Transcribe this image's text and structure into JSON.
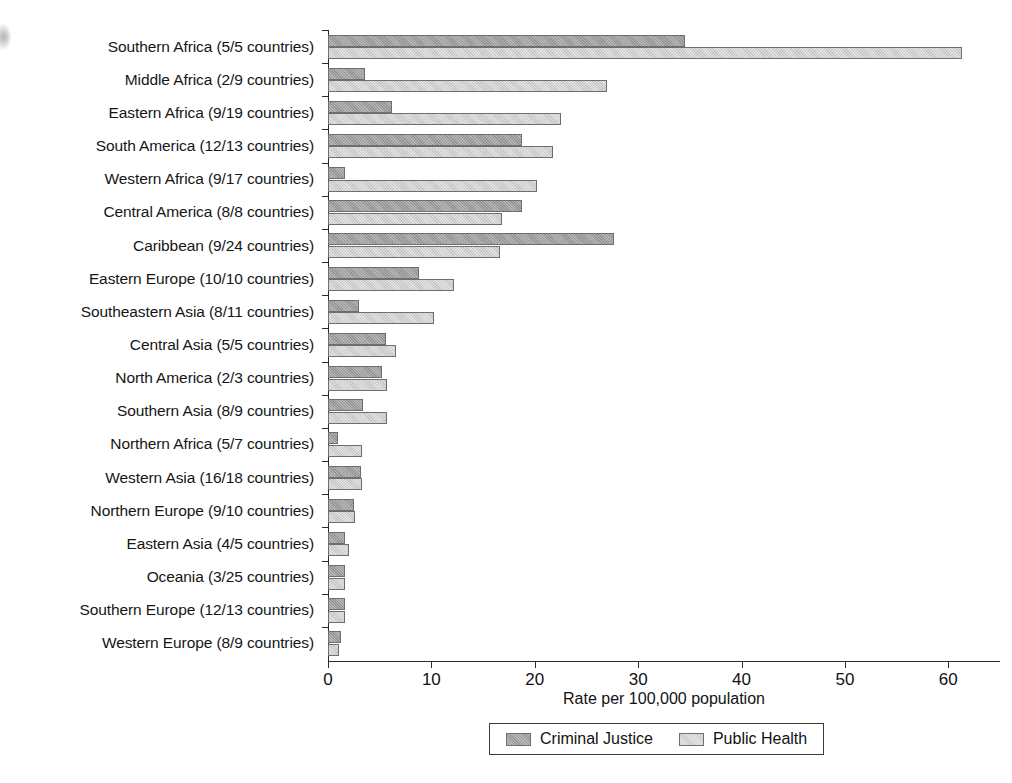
{
  "chart_data": {
    "type": "bar",
    "orientation": "horizontal",
    "title": "",
    "xlabel": "Rate per 100,000 population",
    "ylabel": "",
    "xlim": [
      0,
      65
    ],
    "xticks": [
      0,
      10,
      20,
      30,
      40,
      50,
      60
    ],
    "grid": false,
    "legend_position": "bottom",
    "categories": [
      "Southern Africa (5/5 countries)",
      "Middle Africa (2/9 countries)",
      "Eastern Africa (9/19 countries)",
      "South America (12/13 countries)",
      "Western Africa (9/17 countries)",
      "Central America (8/8 countries)",
      "Caribbean (9/24 countries)",
      "Eastern Europe (10/10 countries)",
      "Southeastern Asia (8/11 countries)",
      "Central Asia (5/5 countries)",
      "North America (2/3 countries)",
      "Southern Asia (8/9 countries)",
      "Northern Africa (5/7 countries)",
      "Western Asia (16/18 countries)",
      "Northern Europe (9/10 countries)",
      "Eastern Asia (4/5 countries)",
      "Oceania (3/25 countries)",
      "Southern Europe (12/13 countries)",
      "Western Europe (8/9 countries)"
    ],
    "series": [
      {
        "name": "Criminal Justice",
        "color": "#9a9a9a",
        "values": [
          34.5,
          3.6,
          6.2,
          18.8,
          1.6,
          18.8,
          27.7,
          8.8,
          3.0,
          5.6,
          5.2,
          3.4,
          1.0,
          3.2,
          2.5,
          1.6,
          1.6,
          1.6,
          1.3
        ]
      },
      {
        "name": "Public Health",
        "color": "#cdcdcd",
        "values": [
          61.3,
          27.0,
          22.5,
          21.8,
          20.2,
          16.8,
          16.6,
          12.2,
          10.3,
          6.6,
          5.7,
          5.7,
          3.3,
          3.3,
          2.6,
          2.0,
          1.6,
          1.6,
          1.1
        ]
      }
    ]
  },
  "legend": {
    "items": [
      {
        "label": "Criminal Justice",
        "swatch": "criminal-justice-swatch"
      },
      {
        "label": "Public Health",
        "swatch": "public-health-swatch"
      }
    ]
  }
}
